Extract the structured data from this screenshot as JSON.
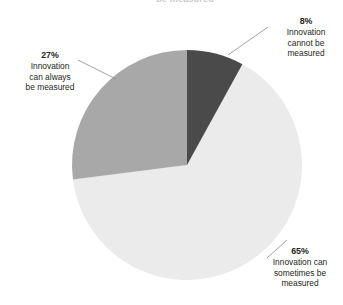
{
  "title_fragment": "be measured",
  "colors": {
    "background": "#ffffff",
    "slice_cannot": "#4a4a4a",
    "slice_sometimes": "#ebebeb",
    "slice_always": "#a8a8a8",
    "text": "#231f20",
    "leader_line": "#8c8c8c"
  },
  "callouts": {
    "cannot": {
      "percent": "8%",
      "line1": "Innovation",
      "line2": "cannot be",
      "line3": "measured"
    },
    "always": {
      "percent": "27%",
      "line1": "Innovation",
      "line2": "can always",
      "line3": "be measured"
    },
    "sometimes": {
      "percent": "65%",
      "line1": "Innovation can",
      "line2": "sometimes be",
      "line3": "measured"
    }
  },
  "chart_data": {
    "type": "pie",
    "title": "",
    "xlabel": "",
    "ylabel": "",
    "legend_position": "none",
    "grid": false,
    "start_angle_deg": 0,
    "direction": "clockwise",
    "center": [
      187,
      165
    ],
    "radius": 115,
    "labels": [
      "Innovation cannot be measured",
      "Innovation can sometimes be measured",
      "Innovation can always be measured"
    ],
    "values": [
      8,
      65,
      27
    ],
    "value_labels": [
      "8%",
      "65%",
      "27%"
    ],
    "colors": [
      "#4a4a4a",
      "#ebebeb",
      "#a8a8a8"
    ],
    "units": "percent",
    "total": 100
  }
}
